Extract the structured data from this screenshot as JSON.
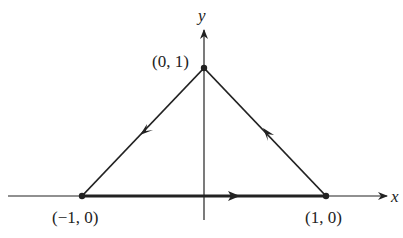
{
  "diagram": {
    "axes": {
      "x_label": "x",
      "y_label": "y"
    },
    "vertices": [
      {
        "id": "top",
        "label": "(0, 1)",
        "x": 0,
        "y": 1
      },
      {
        "id": "left",
        "label": "(−1, 0)",
        "x": -1,
        "y": 0
      },
      {
        "id": "right",
        "label": "(1, 0)",
        "x": 1,
        "y": 0
      }
    ],
    "edges": [
      {
        "from": "left",
        "to": "right",
        "direction": "rightward",
        "style": "thick"
      },
      {
        "from": "right",
        "to": "top",
        "direction": "toward (0, 1)",
        "style": "normal"
      },
      {
        "from": "top",
        "to": "left",
        "direction": "toward (−1, 0)",
        "style": "normal"
      }
    ],
    "colors": {
      "stroke": "#222222",
      "background": "#ffffff"
    }
  }
}
